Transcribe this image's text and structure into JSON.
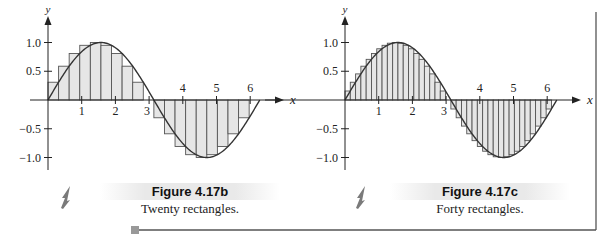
{
  "colors": {
    "fill": "#e6e6e6",
    "stroke": "#555555",
    "axis": "#222222",
    "arrow": "#7a7a7a",
    "frame": "#555555",
    "marker": "#999999"
  },
  "figures": [
    {
      "id": "fig-4-17b",
      "title": "Figure 4.17b",
      "caption": "Twenty rectangles."
    },
    {
      "id": "fig-4-17c",
      "title": "Figure 4.17c",
      "caption": "Forty rectangles."
    }
  ],
  "axes": {
    "x_label": "x",
    "y_label": "y",
    "x_ticks_pos": [
      "1",
      "2",
      "3"
    ],
    "x_ticks_top": [
      "4",
      "5",
      "6"
    ],
    "y_ticks": [
      "1.0",
      "0.5",
      "-0.5",
      "-1.0"
    ]
  },
  "chart_data": [
    {
      "type": "area",
      "title": "Figure 4.17b",
      "subtitle": "Twenty rectangles.",
      "function": "y = sin(x)",
      "xlabel": "x",
      "ylabel": "y",
      "xlim": [
        0,
        6.2832
      ],
      "ylim": [
        -1.2,
        1.2
      ],
      "x_ticks": [
        1,
        2,
        3,
        4,
        5,
        6
      ],
      "y_ticks": [
        -1.0,
        -0.5,
        0.5,
        1.0
      ],
      "rectangles": 20,
      "rule": "right endpoint",
      "grid": false
    },
    {
      "type": "area",
      "title": "Figure 4.17c",
      "subtitle": "Forty rectangles.",
      "function": "y = sin(x)",
      "xlabel": "x",
      "ylabel": "y",
      "xlim": [
        0,
        6.2832
      ],
      "ylim": [
        -1.2,
        1.2
      ],
      "x_ticks": [
        1,
        2,
        3,
        4,
        5,
        6
      ],
      "y_ticks": [
        -1.0,
        -0.5,
        0.5,
        1.0
      ],
      "rectangles": 40,
      "rule": "right endpoint",
      "grid": false
    }
  ]
}
